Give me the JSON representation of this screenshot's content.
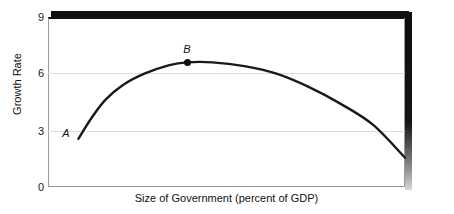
{
  "chart_data": {
    "type": "line",
    "title": "",
    "xlabel": "Size of Government (percent of GDP)",
    "ylabel": "Growth Rate",
    "xlim": [
      0,
      100
    ],
    "ylim": [
      0,
      9
    ],
    "x_ticklabels": [],
    "y_ticklabels": [
      "0",
      "3",
      "6",
      "9"
    ],
    "y_tickvalues": [
      0,
      3,
      6,
      9
    ],
    "grid": "horizontal gridlines at y = 3 and y = 6",
    "legend": "none",
    "series": [
      {
        "name": "Growth rate curve",
        "description": "Inverted-U (Armey) curve: growth rises steeply from point A, peaks at point B, then declines",
        "x": [
          8.5,
          12,
          16,
          21,
          27,
          34,
          39,
          46,
          55,
          64,
          73,
          82,
          91,
          100
        ],
        "y": [
          2.55,
          3.6,
          4.6,
          5.4,
          6.0,
          6.45,
          6.6,
          6.6,
          6.4,
          6.0,
          5.3,
          4.4,
          3.3,
          1.55
        ]
      }
    ],
    "annotations": [
      {
        "label": "A",
        "x": 8.5,
        "y": 2.55,
        "style": "italic",
        "marker": "none",
        "position": "left of curve start"
      },
      {
        "label": "B",
        "x": 39,
        "y": 6.6,
        "style": "italic",
        "marker": "filled-dot",
        "position": "above peak"
      }
    ],
    "colors": {
      "curve": "#1a1a1a",
      "gridline": "#dcdcdc",
      "frame": "#9a9a9a",
      "frame_top": "#111111",
      "shadow": "#0d0d0d",
      "text": "#111111",
      "background": "#ffffff"
    }
  },
  "axes": {
    "y_ticks": {
      "t9": "9",
      "t6": "6",
      "t3": "3",
      "t0": "0"
    },
    "y_title": "Growth Rate",
    "x_title": "Size of Government (percent of GDP)"
  },
  "points": {
    "a_label": "A",
    "b_label": "B"
  }
}
